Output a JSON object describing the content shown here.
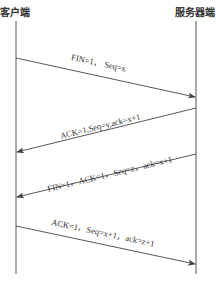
{
  "diagram": {
    "title": "",
    "parties": {
      "client": "客户端",
      "server": "服务器端"
    },
    "messages": [
      {
        "direction": "client-to-server",
        "label": "FIN=1，  Seq=x"
      },
      {
        "direction": "server-to-client",
        "label": "ACK=1,Seq=y,ack=x+1"
      },
      {
        "direction": "server-to-client",
        "label": "FIN=1，ACK=1，Seq=z，ack=x+1"
      },
      {
        "direction": "client-to-server",
        "label": "ACK=1，Seq=x+1，ack=z+1"
      }
    ],
    "colors": {
      "line": "#444444",
      "text": "#333333",
      "background": "#ffffff"
    }
  }
}
